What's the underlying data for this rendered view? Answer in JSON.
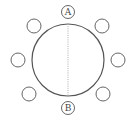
{
  "diagram": {
    "type": "round-table-seating",
    "table": {
      "cx": 68,
      "cy": 60,
      "r": 36
    },
    "divider": {
      "style": "dotted",
      "x": 68,
      "y1": 24,
      "y2": 96
    },
    "labeled_seats": [
      {
        "id": "A",
        "label": "A",
        "cx": 68,
        "cy": 12,
        "r": 6.5
      },
      {
        "id": "B",
        "label": "B",
        "cx": 68,
        "cy": 108,
        "r": 6.5
      }
    ],
    "empty_seats": [
      {
        "cx": 34,
        "cy": 26,
        "r": 7
      },
      {
        "cx": 102,
        "cy": 26,
        "r": 7
      },
      {
        "cx": 18,
        "cy": 60,
        "r": 7
      },
      {
        "cx": 118,
        "cy": 60,
        "r": 7
      },
      {
        "cx": 29,
        "cy": 94,
        "r": 7
      },
      {
        "cx": 103,
        "cy": 94,
        "r": 7
      }
    ],
    "colors": {
      "stroke": "#555555",
      "divider": "#999999",
      "background": "#ffffff"
    }
  }
}
